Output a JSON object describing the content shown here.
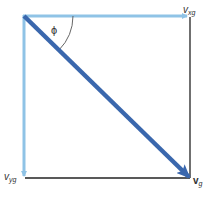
{
  "diagram": {
    "colors": {
      "component_arrow": "#8fc3e6",
      "resultant_arrow": "#3a67ad",
      "frame_line": "#222222",
      "angle_arc": "#555555",
      "label": "#333333"
    },
    "labels": {
      "angle": "ϕ",
      "x_component_base": "v",
      "x_component_sub": "xg",
      "y_component_base": "v",
      "y_component_sub": "yg",
      "resultant_base": "v",
      "resultant_sub": "g"
    }
  }
}
